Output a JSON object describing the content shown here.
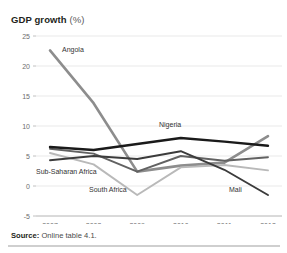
{
  "figure": {
    "title_bold": "GDP growth",
    "title_regular": "(%)",
    "source_bold": "Source:",
    "source_text": "Online table 4.1."
  },
  "chart_data": {
    "type": "line",
    "title": "GDP growth (%)",
    "xlabel": "",
    "ylabel": "",
    "x": [
      "2007",
      "2008",
      "2009",
      "2010",
      "2011",
      "2012"
    ],
    "categories": [
      "2007",
      "2008",
      "2009",
      "2010",
      "2011",
      "2012"
    ],
    "ylim": [
      -5,
      25
    ],
    "yticks": [
      "25",
      "20",
      "15",
      "10",
      "5",
      "0",
      "-5"
    ],
    "ytick_values": [
      25,
      20,
      15,
      10,
      5,
      0,
      -5
    ],
    "grid": "horizontal",
    "legend": "inline-labels",
    "series": [
      {
        "name": "Angola",
        "values": [
          22.6,
          13.8,
          2.4,
          3.4,
          3.9,
          8.3
        ],
        "color": "#8d8d8d",
        "width": 2.6
      },
      {
        "name": "Nigeria",
        "values": [
          6.5,
          6.0,
          7.0,
          8.0,
          7.4,
          6.7
        ],
        "color": "#1a1a1a",
        "width": 2.4
      },
      {
        "name": "Sub-Saharan Africa",
        "values": [
          6.2,
          5.4,
          2.4,
          5.0,
          4.2,
          4.8
        ],
        "color": "#626262",
        "width": 1.9
      },
      {
        "name": "South Africa",
        "values": [
          5.5,
          3.6,
          -1.5,
          3.1,
          3.5,
          2.6
        ],
        "color": "#b9b9b9",
        "width": 1.9
      },
      {
        "name": "Mali",
        "values": [
          4.3,
          5.0,
          4.5,
          5.8,
          2.7,
          -1.5
        ],
        "color": "#3b3b3b",
        "width": 1.9
      }
    ],
    "annotations": [
      {
        "text": "Angola",
        "series": "Angola"
      },
      {
        "text": "Nigeria",
        "series": "Nigeria"
      },
      {
        "text": "Sub-Saharan Africa",
        "series": "Sub-Saharan Africa"
      },
      {
        "text": "South Africa",
        "series": "South Africa"
      },
      {
        "text": "Mali",
        "series": "Mali"
      }
    ]
  },
  "colors": {
    "background": "#ffffff",
    "text": "#231f20",
    "grid": "#e3e3e3",
    "axis": "#b9b9b9",
    "rule": "#cfcfcf"
  }
}
